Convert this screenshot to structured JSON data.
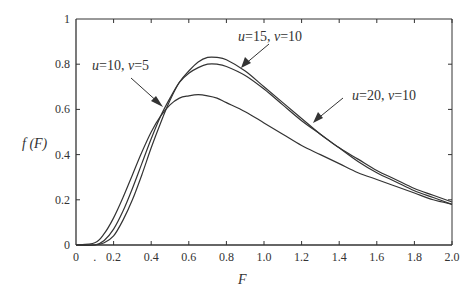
{
  "chart_data": {
    "type": "line",
    "title": "",
    "xlabel": "F",
    "ylabel": "f (F)",
    "xlim": [
      0,
      2.0
    ],
    "ylim": [
      0,
      1
    ],
    "grid": false,
    "legend": "none (inline annotations with arrows)",
    "x_ticks": [
      "0",
      ".",
      "0.2",
      "0.4",
      "0.6",
      "0.8",
      "1.0",
      "1.2",
      "1.4",
      "1.6",
      "1.8",
      "2.0"
    ],
    "y_ticks": [
      "0",
      "0.2",
      "0.4",
      "0.6",
      "0.8",
      "1"
    ],
    "x": [
      0.0,
      0.1,
      0.15,
      0.2,
      0.25,
      0.3,
      0.35,
      0.4,
      0.45,
      0.5,
      0.55,
      0.6,
      0.65,
      0.7,
      0.75,
      0.8,
      0.9,
      1.0,
      1.1,
      1.2,
      1.3,
      1.4,
      1.5,
      1.6,
      1.7,
      1.8,
      1.9,
      2.0
    ],
    "series": [
      {
        "name": "u=10, ν=5",
        "values": [
          0.0,
          0.01,
          0.05,
          0.12,
          0.21,
          0.31,
          0.41,
          0.5,
          0.57,
          0.62,
          0.65,
          0.66,
          0.665,
          0.66,
          0.65,
          0.63,
          0.59,
          0.54,
          0.49,
          0.44,
          0.4,
          0.36,
          0.32,
          0.29,
          0.26,
          0.23,
          0.2,
          0.18
        ]
      },
      {
        "name": "u=15, ν=10",
        "values": [
          0.0,
          0.0,
          0.02,
          0.07,
          0.15,
          0.25,
          0.36,
          0.47,
          0.57,
          0.65,
          0.72,
          0.76,
          0.785,
          0.8,
          0.8,
          0.79,
          0.75,
          0.69,
          0.62,
          0.55,
          0.49,
          0.43,
          0.38,
          0.33,
          0.29,
          0.25,
          0.22,
          0.19
        ]
      },
      {
        "name": "u=20, ν=10",
        "values": [
          0.0,
          0.0,
          0.01,
          0.04,
          0.11,
          0.2,
          0.31,
          0.43,
          0.54,
          0.64,
          0.72,
          0.77,
          0.81,
          0.83,
          0.83,
          0.82,
          0.77,
          0.7,
          0.63,
          0.56,
          0.49,
          0.43,
          0.37,
          0.32,
          0.28,
          0.24,
          0.21,
          0.18
        ]
      }
    ],
    "annotations": [
      {
        "text_var1": "u",
        "text_mid1": "=10, ",
        "text_var2": "ν",
        "text_mid2": "=5",
        "points_to": "u=10, ν=5"
      },
      {
        "text_var1": "u",
        "text_mid1": "=15,  ",
        "text_var2": "ν",
        "text_mid2": "=10",
        "points_to": "u=15, ν=10"
      },
      {
        "text_var1": "u",
        "text_mid1": "=20, ",
        "text_var2": "ν",
        "text_mid2": "=10",
        "points_to": "u=20, ν=10"
      }
    ]
  }
}
